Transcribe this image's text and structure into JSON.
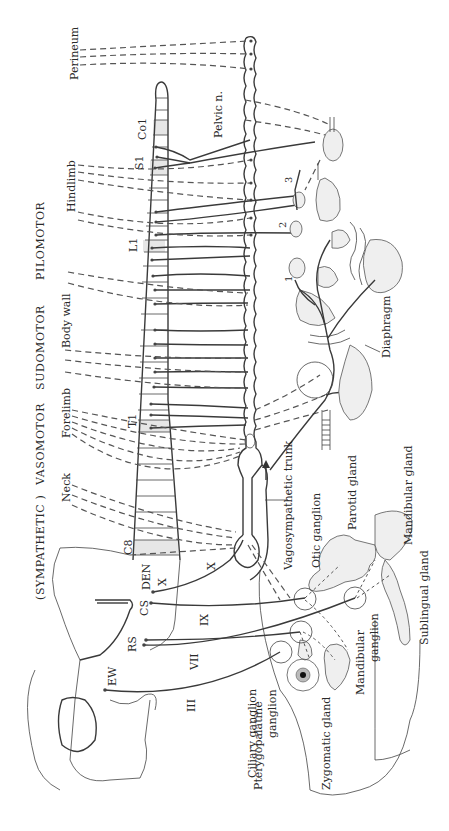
{
  "figure": {
    "header": {
      "sympathetic": "(SYMPATHETIC )",
      "vasomotor": "VASOMOTOR",
      "sudomotor": "SUDOMOTOR",
      "pilomotor": "PILOMOTOR"
    },
    "targets": {
      "perineum": "Perineum",
      "hindlimb": "Hindlimb",
      "body_wall": "Body wall",
      "forelimb": "Forelimb",
      "neck": "Neck"
    },
    "spinal_segments": {
      "co1": "Co1",
      "s1": "S1",
      "l1": "L1",
      "t1": "T1",
      "c8": "C8"
    },
    "brainstem_nuclei": {
      "den": "DEN",
      "cs": "CS",
      "rs": "RS",
      "ew": "EW"
    },
    "cranial_nerves": {
      "x_inner": "X",
      "x_outer": "X",
      "ix": "IX",
      "vii": "VII",
      "iii": "III"
    },
    "nerves": {
      "pelvic": "Pelvic n.",
      "vagosympathetic": "Vagosympathetic trunk"
    },
    "ganglia_numbers": [
      "1",
      "2",
      "3"
    ],
    "structures": {
      "diaphragm": "Diaphragm",
      "mandibular_gland": "Mandibular gland",
      "parotid_gland": "Parotid gland",
      "otic_ganglion": "Otic ganglion",
      "sublingual_gland": "Sublingual gland",
      "mandibular_ganglion": [
        "Mandibular",
        "ganglion"
      ],
      "zygomatic_gland": "Zygomatic gland",
      "pterygopalatine_ganglion": [
        "Pterygopalatine",
        "ganglion"
      ],
      "ciliary_ganglion": "Ciliary ganglion"
    }
  }
}
